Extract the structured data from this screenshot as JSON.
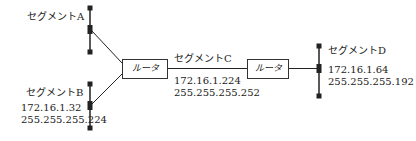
{
  "segments": {
    "a": {
      "name": "セグメントA"
    },
    "b": {
      "name": "セグメントB",
      "address": "172.16.1.32",
      "mask": "255.255.255.224"
    },
    "c": {
      "name": "セグメントC",
      "address": "172.16.1.224",
      "mask": "255.255.255.252"
    },
    "d": {
      "name": "セグメントD",
      "address": "172.16.1.64",
      "mask": "255.255.255.192"
    }
  },
  "routers": [
    {
      "label": "ルータ"
    },
    {
      "label": "ルータ"
    }
  ],
  "colors": {
    "line": "#222222"
  }
}
